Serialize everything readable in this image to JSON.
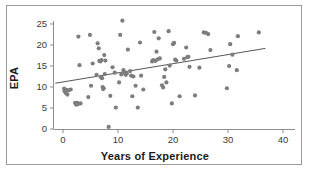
{
  "figure": {
    "border_color": "#9a9a9a",
    "background": "#ffffff"
  },
  "chart_data": {
    "type": "scatter",
    "title": "",
    "xlabel": "Years of Experience",
    "ylabel": "EPA",
    "xlim": [
      -1.5,
      43
    ],
    "ylim": [
      -1.2,
      26.8
    ],
    "xticks": [
      0,
      10,
      20,
      30,
      40
    ],
    "yticks": [
      0,
      5,
      10,
      15,
      20,
      25
    ],
    "xtick_labels": [
      "0",
      "10",
      "20",
      "30",
      "40"
    ],
    "ytick_labels": [
      "0",
      "5",
      "10",
      "15",
      "20",
      "25"
    ],
    "grid": false,
    "legend": null,
    "marker_color": "#7d7d7d",
    "marker_size": 3.1,
    "axis_color": "#8d8d8d",
    "trend_line": {
      "type": "linear-fit",
      "color": "#555555",
      "x_start": -1.4,
      "y_start": 10.9,
      "x_end": 36.8,
      "y_end": 19.2
    },
    "series": [
      {
        "name": "EPA vs Years of Experience",
        "points": [
          [
            0.2,
            9.6
          ],
          [
            0.3,
            9.0
          ],
          [
            0.5,
            8.6
          ],
          [
            0.6,
            9.3
          ],
          [
            0.8,
            8.2
          ],
          [
            1.0,
            9.2
          ],
          [
            1.4,
            9.4
          ],
          [
            2.2,
            6.2
          ],
          [
            2.4,
            5.8
          ],
          [
            2.6,
            6.2
          ],
          [
            2.7,
            5.9
          ],
          [
            2.8,
            22.0
          ],
          [
            3.0,
            15.2
          ],
          [
            3.2,
            6.1
          ],
          [
            4.6,
            7.6
          ],
          [
            4.9,
            22.4
          ],
          [
            5.1,
            10.3
          ],
          [
            5.4,
            15.6
          ],
          [
            6.1,
            12.9
          ],
          [
            6.3,
            20.4
          ],
          [
            6.5,
            19.2
          ],
          [
            6.6,
            16.2
          ],
          [
            6.8,
            16.1
          ],
          [
            6.9,
            12.3
          ],
          [
            7.0,
            16.4
          ],
          [
            7.1,
            12.1
          ],
          [
            7.2,
            10.0
          ],
          [
            7.3,
            9.5
          ],
          [
            7.4,
            9.7
          ],
          [
            7.5,
            17.6
          ],
          [
            7.6,
            13.1
          ],
          [
            7.7,
            16.3
          ],
          [
            8.3,
            0.5
          ],
          [
            8.6,
            7.9
          ],
          [
            9.0,
            14.7
          ],
          [
            9.4,
            13.4
          ],
          [
            9.6,
            5.1
          ],
          [
            10.2,
            11.1
          ],
          [
            10.4,
            22.4
          ],
          [
            10.6,
            13.0
          ],
          [
            10.8,
            25.8
          ],
          [
            11.0,
            14.0
          ],
          [
            11.2,
            13.4
          ],
          [
            11.4,
            12.9
          ],
          [
            11.6,
            13.2
          ],
          [
            11.8,
            18.9
          ],
          [
            12.2,
            13.8
          ],
          [
            12.4,
            12.7
          ],
          [
            12.6,
            7.8
          ],
          [
            12.8,
            12.5
          ],
          [
            13.2,
            10.3
          ],
          [
            13.6,
            5.1
          ],
          [
            14.0,
            20.6
          ],
          [
            14.2,
            12.7
          ],
          [
            14.6,
            9.4
          ],
          [
            16.2,
            16.1
          ],
          [
            16.4,
            16.4
          ],
          [
            16.6,
            23.1
          ],
          [
            16.8,
            16.2
          ],
          [
            17.0,
            18.4
          ],
          [
            17.2,
            16.6
          ],
          [
            17.4,
            21.6
          ],
          [
            17.6,
            16.8
          ],
          [
            18.0,
            10.4
          ],
          [
            18.2,
            9.9
          ],
          [
            18.4,
            12.4
          ],
          [
            18.6,
            14.2
          ],
          [
            18.8,
            11.1
          ],
          [
            19.2,
            23.3
          ],
          [
            19.4,
            15.1
          ],
          [
            19.8,
            6.1
          ],
          [
            20.0,
            20.2
          ],
          [
            20.2,
            20.5
          ],
          [
            20.4,
            16.5
          ],
          [
            20.6,
            16.3
          ],
          [
            21.2,
            7.8
          ],
          [
            22.0,
            16.7
          ],
          [
            22.4,
            19.4
          ],
          [
            22.6,
            17.1
          ],
          [
            22.8,
            17.2
          ],
          [
            23.0,
            14.8
          ],
          [
            24.0,
            8.0
          ],
          [
            24.8,
            14.6
          ],
          [
            25.6,
            23.0
          ],
          [
            26.0,
            22.9
          ],
          [
            26.4,
            22.6
          ],
          [
            26.8,
            18.8
          ],
          [
            29.8,
            9.7
          ],
          [
            30.2,
            15.0
          ],
          [
            30.4,
            20.2
          ],
          [
            30.8,
            17.7
          ],
          [
            31.6,
            14.0
          ],
          [
            31.8,
            22.1
          ],
          [
            35.6,
            23.0
          ]
        ]
      }
    ]
  }
}
